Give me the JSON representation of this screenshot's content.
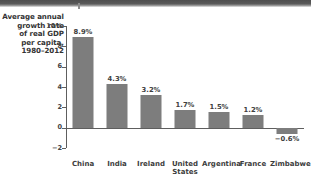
{
  "figure": {
    "axis_caption_lines": [
      "Average annual",
      "growth rate",
      "of real GDP",
      "per capita,",
      "1980–2012"
    ]
  },
  "chart_data": {
    "type": "bar",
    "title": "",
    "subtitle": "",
    "xlabel": "",
    "ylabel": "Average annual growth rate of real GDP per capita, 1980–2012",
    "categories": [
      "China",
      "India",
      "Ireland",
      "United States",
      "Argentina",
      "France",
      "Zimbabwe"
    ],
    "category_label_lines": [
      [
        "China"
      ],
      [
        "India"
      ],
      [
        "Ireland"
      ],
      [
        "United",
        "States"
      ],
      [
        "Argentina"
      ],
      [
        "France"
      ],
      [
        "Zimbabwe"
      ]
    ],
    "values": [
      8.9,
      4.3,
      3.2,
      1.7,
      1.5,
      1.2,
      -0.6
    ],
    "value_labels": [
      "8.9%",
      "4.3%",
      "3.2%",
      "1.7%",
      "1.5%",
      "1.2%",
      "−0.6%"
    ],
    "ylim": [
      -2,
      10
    ],
    "yticks": [
      10,
      8,
      6,
      4,
      2,
      0,
      -2
    ],
    "ytick_labels": [
      "10%",
      "8",
      "6",
      "4",
      "2",
      "0",
      "−2"
    ],
    "grid": false,
    "legend": "none",
    "bar_color": "#7d7d7d",
    "axis_color": "#5e5e5e",
    "text_color": "#3a3a3a"
  }
}
